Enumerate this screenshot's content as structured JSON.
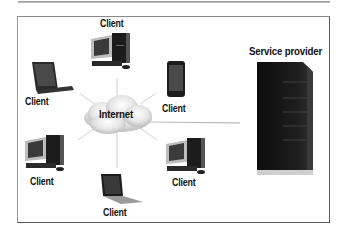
{
  "diagram": {
    "type": "client-server network",
    "hub": {
      "label": "Internet",
      "icon": "cloud-icon"
    },
    "server": {
      "label": "Service provider",
      "icon": "server-tower-icon"
    },
    "clients": [
      {
        "label": "Client",
        "icon": "desktop-computer-icon",
        "position": "top"
      },
      {
        "label": "Client",
        "icon": "tablet-icon",
        "position": "upper-left"
      },
      {
        "label": "Client",
        "icon": "smartphone-icon",
        "position": "upper-right"
      },
      {
        "label": "Client",
        "icon": "desktop-computer-icon",
        "position": "lower-left"
      },
      {
        "label": "Client",
        "icon": "laptop-icon",
        "position": "bottom"
      },
      {
        "label": "Client",
        "icon": "desktop-computer-icon",
        "position": "lower-right"
      }
    ]
  },
  "colors": {
    "frame": "#5a5a5a",
    "device": "#1a1a1a",
    "connector": "#b8b8b8",
    "cloud": "#d8d8d8"
  }
}
